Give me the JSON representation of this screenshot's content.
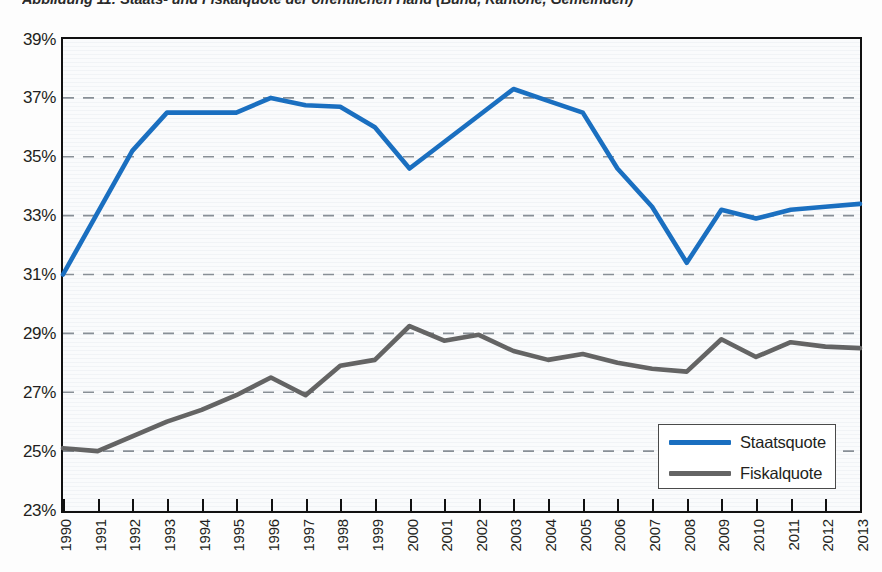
{
  "caption": "Abbildung 11: Staats- und Fiskalquote der öffentlichen Hand (Bund, Kantone, Gemeinden)",
  "legend": {
    "items": [
      {
        "label": "Staatsquote",
        "color": "#1a6fc0"
      },
      {
        "label": "Fiskalquote",
        "color": "#646464"
      }
    ]
  },
  "axis": {
    "y_ticks": [
      "39%",
      "37%",
      "35%",
      "33%",
      "31%",
      "29%",
      "27%",
      "25%",
      "23%"
    ],
    "x_ticks": [
      "1990",
      "1991",
      "1992",
      "1993",
      "1994",
      "1995",
      "1996",
      "1997",
      "1998",
      "1999",
      "2000",
      "2001",
      "2002",
      "2003",
      "2004",
      "2005",
      "2006",
      "2007",
      "2008",
      "2009",
      "2010",
      "2011",
      "2012",
      "2013"
    ]
  },
  "chart_data": {
    "type": "line",
    "title": "Abbildung 11: Staats- und Fiskalquote der öffentlichen Hand (Bund, Kantone, Gemeinden)",
    "xlabel": "",
    "ylabel": "",
    "ylim": [
      23,
      39
    ],
    "ytick_values": [
      23,
      25,
      27,
      29,
      31,
      33,
      35,
      37,
      39
    ],
    "ytick_suffix": "%",
    "grid": "horizontal-dashed",
    "legend_position": "bottom-right",
    "x": [
      1990,
      1991,
      1992,
      1993,
      1994,
      1995,
      1996,
      1997,
      1998,
      1999,
      2000,
      2001,
      2002,
      2003,
      2004,
      2005,
      2006,
      2007,
      2008,
      2009,
      2010,
      2011,
      2012,
      2013
    ],
    "series": [
      {
        "name": "Staatsquote",
        "color": "#1a6fc0",
        "values": [
          31.0,
          33.1,
          35.2,
          36.5,
          36.5,
          36.5,
          37.0,
          36.75,
          36.7,
          36.0,
          34.6,
          35.5,
          36.4,
          37.3,
          36.9,
          36.5,
          34.6,
          33.3,
          31.4,
          33.2,
          32.9,
          33.2,
          33.3,
          33.4
        ]
      },
      {
        "name": "Fiskalquote",
        "color": "#646464",
        "values": [
          25.1,
          25.0,
          25.5,
          26.0,
          26.4,
          26.9,
          27.5,
          26.9,
          27.9,
          28.1,
          29.25,
          28.75,
          28.95,
          28.4,
          28.1,
          28.3,
          28.0,
          27.8,
          27.7,
          28.8,
          28.2,
          28.7,
          28.55,
          28.5
        ]
      }
    ]
  }
}
